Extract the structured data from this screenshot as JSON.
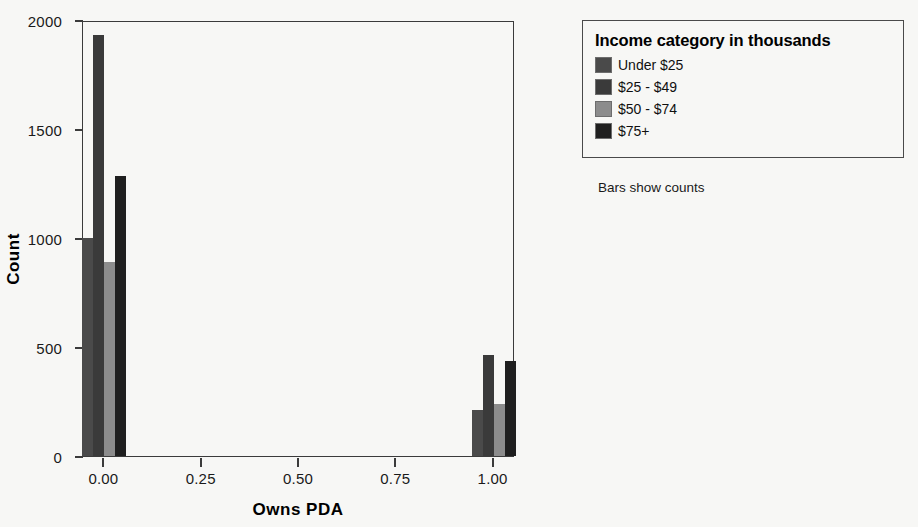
{
  "chart_data": {
    "type": "bar",
    "title": "",
    "xlabel": "Owns PDA",
    "ylabel": "Count",
    "xlim": [
      -0.055,
      1.055
    ],
    "ylim": [
      0,
      2000
    ],
    "xticks": [
      "0.00",
      "0.25",
      "0.50",
      "0.75",
      "1.00"
    ],
    "xtick_values": [
      0.0,
      0.25,
      0.5,
      0.75,
      1.0
    ],
    "yticks": [
      "0",
      "500",
      "1000",
      "1500",
      "2000"
    ],
    "ytick_values": [
      0,
      500,
      1000,
      1500,
      2000
    ],
    "grid": false,
    "legend_position": "right-outside",
    "legend_title": "Income category in thousands",
    "footnote": "Bars show counts",
    "categories": [
      "0.00",
      "1.00"
    ],
    "series": [
      {
        "name": "Under $25",
        "color": "#4a4a4a",
        "values": [
          1000,
          210
        ]
      },
      {
        "name": "$25 - $49",
        "color": "#3a3a3a",
        "values": [
          1930,
          465
        ]
      },
      {
        "name": "$50 - $74",
        "color": "#8c8c8c",
        "values": [
          890,
          240
        ]
      },
      {
        "name": "$75+",
        "color": "#1f1f1f",
        "values": [
          1285,
          435
        ]
      }
    ]
  },
  "legend": {
    "title": "Income category in thousands",
    "items": [
      {
        "label": "Under $25",
        "color": "#4a4a4a"
      },
      {
        "label": "$25 - $49",
        "color": "#3a3a3a"
      },
      {
        "label": "$50 - $74",
        "color": "#8c8c8c"
      },
      {
        "label": "$75+",
        "color": "#1f1f1f"
      }
    ]
  },
  "axes": {
    "y_title": "Count",
    "x_title": "Owns PDA",
    "y_labels": [
      "2000",
      "1500",
      "1000",
      "500",
      "0"
    ],
    "x_labels": [
      "0.00",
      "0.25",
      "0.50",
      "0.75",
      "1.00"
    ]
  },
  "footnote": "Bars show counts"
}
